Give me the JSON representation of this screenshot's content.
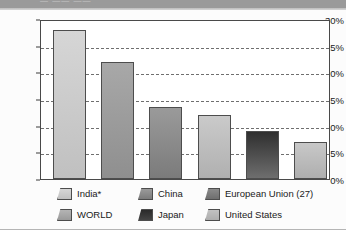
{
  "top_band": {
    "remnant_text": "— —— ——"
  },
  "chart_data": {
    "type": "bar",
    "title": "",
    "subtitle": "",
    "xlabel": "",
    "ylabel": "",
    "ylim": [
      0,
      30
    ],
    "yticks": [
      "0%",
      "5%",
      "10%",
      "15%",
      "20%",
      "25%",
      "30%"
    ],
    "ytick_values": [
      0,
      5,
      10,
      15,
      20,
      25,
      30
    ],
    "grid": true,
    "legend_position": "bottom",
    "categories": [
      "India*",
      "WORLD",
      "China",
      "Japan",
      "European Union (27)",
      "United States"
    ],
    "values": [
      28,
      22,
      13.5,
      12,
      9,
      7
    ],
    "value_labels": [
      "28%",
      "22%",
      "13.5%",
      "12%",
      "9%",
      "7%"
    ],
    "bars": [
      {
        "name": "India*",
        "value": 28,
        "color": "#cacaca",
        "color_top": "#d6d6d6",
        "color_bottom": "#c0c0c0"
      },
      {
        "name": "WORLD",
        "value": 22,
        "color": "#9e9e9e",
        "color_top": "#a8a8a8",
        "color_bottom": "#8f8f8f"
      },
      {
        "name": "China",
        "value": 13.5,
        "color": "#8a8a8a",
        "color_top": "#9a9a9a",
        "color_bottom": "#7b7b7b"
      },
      {
        "name": "Japan",
        "value": 12,
        "color": "#bdbdbd",
        "color_top": "#cacaca",
        "color_bottom": "#b0b0b0"
      },
      {
        "name": "European Union (27)",
        "value": 9,
        "color": "#4a4a4a",
        "color_top": "#2f2f2f",
        "color_bottom": "#6e6e6e"
      },
      {
        "name": "United States",
        "value": 7,
        "color": "#bcbcbc",
        "color_top": "#c8c8c8",
        "color_bottom": "#aeaeae"
      }
    ]
  },
  "legend": {
    "rows": [
      [
        {
          "label": "India*",
          "color_top": "#d6d6d6",
          "color_bottom": "#c0c0c0"
        },
        {
          "label": "China",
          "color_top": "#9a9a9a",
          "color_bottom": "#7b7b7b"
        },
        {
          "label": "European Union (27)",
          "color_top": "#8a8a8a",
          "color_bottom": "#6e6e6e"
        }
      ],
      [
        {
          "label": "WORLD",
          "color_top": "#b4b4b4",
          "color_bottom": "#9a9a9a"
        },
        {
          "label": "Japan",
          "color_top": "#2a2a2a",
          "color_bottom": "#444444"
        },
        {
          "label": "United States",
          "color_top": "#c2c2c2",
          "color_bottom": "#aeaeae"
        }
      ]
    ]
  },
  "colors": {
    "band": "#9a9a9a",
    "axis": "#4a4a4a",
    "grid": "#6f6f6f",
    "text": "#1a1a1a",
    "plot_bg": "#ffffff"
  }
}
